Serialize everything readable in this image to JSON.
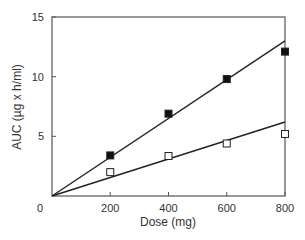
{
  "chart_data": {
    "type": "scatter",
    "title": "",
    "xlabel": "Dose (mg)",
    "ylabel": "AUC (µg x h/ml)",
    "xlim": [
      0,
      800
    ],
    "ylim": [
      0,
      15
    ],
    "xticks": [
      0,
      200,
      400,
      600,
      800
    ],
    "yticks": [
      0,
      5,
      10,
      15
    ],
    "xtick_labels": [
      "0",
      "200",
      "400",
      "600",
      "800"
    ],
    "ytick_labels": [
      "5",
      "10",
      "15"
    ],
    "origin_label": "0",
    "grid": false,
    "legend": null,
    "series": [
      {
        "name": "filled squares",
        "marker": "filled-square",
        "x": [
          200,
          400,
          600,
          800
        ],
        "values": [
          3.4,
          6.9,
          9.8,
          12.1
        ],
        "fit_line": {
          "x": [
            0,
            800
          ],
          "y": [
            0,
            13.0
          ]
        }
      },
      {
        "name": "open squares",
        "marker": "open-square",
        "x": [
          200,
          400,
          600,
          800
        ],
        "values": [
          2.0,
          3.35,
          4.4,
          5.2
        ],
        "fit_line": {
          "x": [
            0,
            800
          ],
          "y": [
            0,
            6.2
          ]
        }
      }
    ]
  }
}
